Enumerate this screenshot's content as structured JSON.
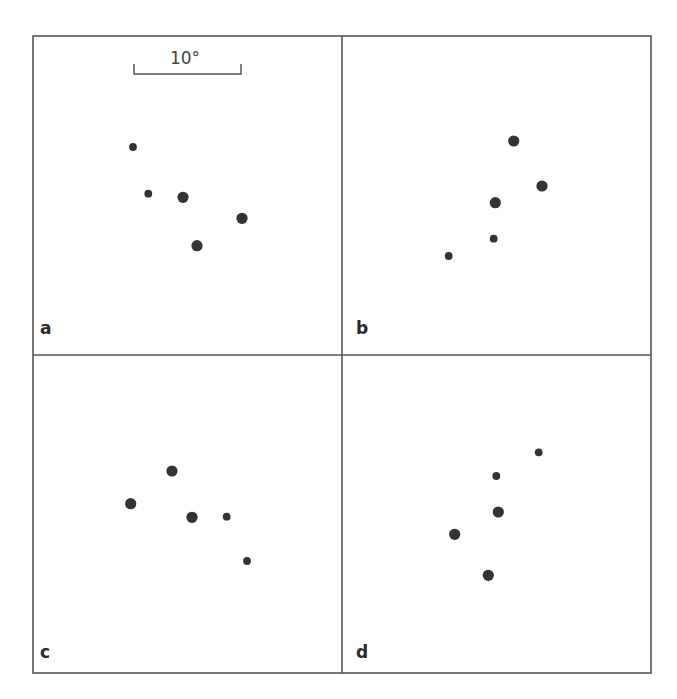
{
  "figure": {
    "frame": {
      "x0": 33,
      "y0": 36,
      "x1": 651,
      "y1": 673,
      "cx": 342,
      "cy": 355,
      "stroke": "#555555"
    },
    "dot_color": "#333333",
    "dot_radius": {
      "large": 5.6,
      "small": 3.9
    },
    "scale_bar": {
      "label": "10°",
      "x0": 134,
      "x1": 241,
      "y": 74,
      "tick_top": 64,
      "label_x": 185,
      "label_y": 64
    }
  },
  "panels": [
    {
      "label": "a",
      "label_x": 40,
      "label_y": 334,
      "dots": [
        {
          "x": 133,
          "y": 147,
          "size": "small"
        },
        {
          "x": 148.3,
          "y": 193.7,
          "size": "small"
        },
        {
          "x": 183,
          "y": 197.3,
          "size": "large"
        },
        {
          "x": 242,
          "y": 218.3,
          "size": "large"
        },
        {
          "x": 197,
          "y": 245.7,
          "size": "large"
        }
      ]
    },
    {
      "label": "b",
      "label_x": 356,
      "label_y": 334,
      "dots": [
        {
          "x": 513.7,
          "y": 141,
          "size": "large"
        },
        {
          "x": 542,
          "y": 186,
          "size": "large"
        },
        {
          "x": 495.3,
          "y": 202.7,
          "size": "large"
        },
        {
          "x": 493.7,
          "y": 238.7,
          "size": "small"
        },
        {
          "x": 448.7,
          "y": 256,
          "size": "small"
        }
      ]
    },
    {
      "label": "c",
      "label_x": 40,
      "label_y": 658,
      "dots": [
        {
          "x": 172,
          "y": 471,
          "size": "large"
        },
        {
          "x": 130.7,
          "y": 503.7,
          "size": "large"
        },
        {
          "x": 192,
          "y": 517.3,
          "size": "large"
        },
        {
          "x": 226.7,
          "y": 516.7,
          "size": "small"
        },
        {
          "x": 247,
          "y": 561,
          "size": "small"
        }
      ]
    },
    {
      "label": "d",
      "label_x": 356,
      "label_y": 658,
      "dots": [
        {
          "x": 538.7,
          "y": 452.3,
          "size": "small"
        },
        {
          "x": 496.3,
          "y": 476,
          "size": "small"
        },
        {
          "x": 498.3,
          "y": 512,
          "size": "large"
        },
        {
          "x": 454.7,
          "y": 534.3,
          "size": "large"
        },
        {
          "x": 488.3,
          "y": 575.3,
          "size": "large"
        }
      ]
    }
  ]
}
